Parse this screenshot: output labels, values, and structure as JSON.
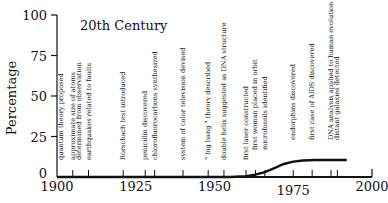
{
  "chart_data": {
    "type": "line",
    "title": "20th Century",
    "xlabel": "",
    "ylabel": "Percentage",
    "xlim": [
      1900,
      2000
    ],
    "ylim": [
      0,
      100
    ],
    "x_ticks": [
      1900,
      1925,
      1950,
      1975,
      2000
    ],
    "y_ticks": [
      0,
      25,
      50,
      75,
      100
    ],
    "grid": false,
    "series": [
      {
        "name": "Percentage",
        "x": [
          1900,
          1955,
          1960,
          1963,
          1966,
          1969,
          1972,
          1975,
          1978,
          1982,
          1986,
          1992
        ],
        "values": [
          0,
          0,
          0.5,
          1.5,
          3,
          5.5,
          8,
          9.5,
          10.2,
          10.5,
          10.5,
          10.5
        ]
      }
    ],
    "annotations": [
      {
        "year": 1900,
        "label": "quantum theory proposed"
      },
      {
        "year": 1905,
        "label": "approximate size of atoms determined from observation"
      },
      {
        "year": 1910,
        "label": "earthquakes related to faults"
      },
      {
        "year": 1921,
        "label": "Rorschach test introduced"
      },
      {
        "year": 1928,
        "label": "penicillin discovered"
      },
      {
        "year": 1931,
        "label": "chlorofluorocarbons synthesized"
      },
      {
        "year": 1940,
        "label": "system of color television devised"
      },
      {
        "year": 1948,
        "label": "\" big bang \" theory described"
      },
      {
        "year": 1953,
        "label": "double helix suggested as DNA structure"
      },
      {
        "year": 1960,
        "label": "first laser constructed"
      },
      {
        "year": 1963,
        "label": "first woman placed in orbit"
      },
      {
        "year": 1966,
        "label": "microfossils identified"
      },
      {
        "year": 1975,
        "label": "endorphins discovered"
      },
      {
        "year": 1981,
        "label": "first case of AIDS discovered"
      },
      {
        "year": 1987,
        "label": "DNA analysis applied to human evolution"
      },
      {
        "year": 1989,
        "label": "distant galaxies detected"
      }
    ]
  }
}
